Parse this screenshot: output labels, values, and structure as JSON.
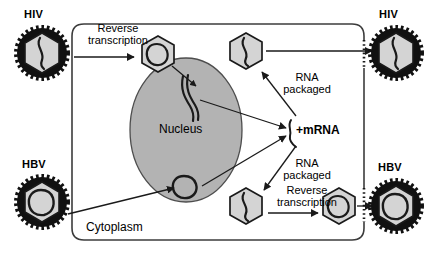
{
  "figure": {
    "width": 431,
    "height": 261,
    "background_color": "#ffffff"
  },
  "colors": {
    "stroke": "#1a1a1a",
    "cell_border": "#3c3c3c",
    "nucleus_fill": "#b3b3b3",
    "nucleus_stroke": "#4d4d4d",
    "capsid_fill": "#d4d4d4",
    "capsid_stroke": "#1a1a1a",
    "envelope_fill": "#111111",
    "genome_stroke": "#1a1a1a",
    "background": "#ffffff"
  },
  "cell": {
    "cytoplasm_label": "Cytoplasm",
    "nucleus_label": "Nucleus"
  },
  "virus_labels": {
    "hiv_entry": "HIV",
    "hiv_exit": "HIV",
    "hbv_entry": "HBV",
    "hbv_exit": "HBV"
  },
  "process_labels": {
    "reverse_transcription_top": "Reverse\ntranscription",
    "rna_packaged_top": "RNA\npackaged",
    "rna_packaged_bottom": "RNA\npackaged",
    "reverse_transcription_bottom": "Reverse\ntranscription",
    "mrna": "+mRNA"
  },
  "particles": [
    {
      "id": "hiv-entry-virion",
      "name": "hiv-entry-virion",
      "type": "enveloped-virion",
      "genome": "rna-strand",
      "has_envelope": true,
      "cx": 42,
      "cy": 53,
      "r": 25
    },
    {
      "id": "hiv-capsid-cytoplasm",
      "name": "hiv-capsid-after-reverse-transcription",
      "type": "naked-capsid",
      "genome": "circular-dna",
      "has_envelope": false,
      "cx": 158,
      "cy": 54,
      "r": 19
    },
    {
      "id": "hiv-capsid-assembled",
      "name": "hiv-assembled-capsid",
      "type": "naked-capsid",
      "genome": "rna-strand",
      "has_envelope": false,
      "cx": 246,
      "cy": 51,
      "r": 19
    },
    {
      "id": "hiv-exit-virion",
      "name": "hiv-exit-virion",
      "type": "enveloped-virion",
      "genome": "rna-strand",
      "has_envelope": true,
      "cx": 396,
      "cy": 53,
      "r": 25
    },
    {
      "id": "hbv-entry-virion",
      "name": "hbv-entry-virion",
      "type": "enveloped-virion",
      "genome": "circular-dna",
      "has_envelope": true,
      "cx": 42,
      "cy": 202,
      "r": 25
    },
    {
      "id": "hbv-capsid-assembled",
      "name": "hbv-assembled-capsid",
      "type": "naked-capsid",
      "genome": "rna-strand",
      "has_envelope": false,
      "cx": 246,
      "cy": 206,
      "r": 19
    },
    {
      "id": "hbv-capsid-dna",
      "name": "hbv-capsid-after-reverse-transcription",
      "type": "naked-capsid",
      "genome": "circular-dna",
      "has_envelope": false,
      "cx": 339,
      "cy": 206,
      "r": 19
    },
    {
      "id": "hbv-exit-virion",
      "name": "hbv-exit-virion",
      "type": "enveloped-virion",
      "genome": "circular-dna",
      "has_envelope": true,
      "cx": 396,
      "cy": 206,
      "r": 25
    }
  ],
  "nuclear_genomes": [
    {
      "id": "hiv-provirus",
      "name": "integrated-provirus-dna",
      "shape": "double-strand-line",
      "description": "integrated HIV provirus"
    },
    {
      "id": "hbv-cccdna",
      "name": "episomal-circular-dna",
      "shape": "circle",
      "description": "HBV covalently closed circular DNA"
    }
  ]
}
